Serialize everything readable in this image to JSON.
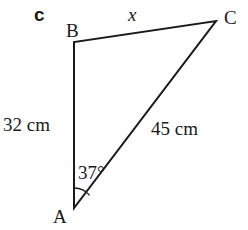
{
  "part_label": "c",
  "vertices": {
    "A": {
      "label": "A",
      "x": 74,
      "y": 208
    },
    "B": {
      "label": "B",
      "x": 74,
      "y": 42
    },
    "C": {
      "label": "C",
      "x": 216,
      "y": 21
    }
  },
  "sides": {
    "AB": "32 cm",
    "AC": "45 cm",
    "BC": "x"
  },
  "angle_A": "37°",
  "colors": {
    "stroke": "#1a1a1a",
    "background": "#ffffff"
  }
}
